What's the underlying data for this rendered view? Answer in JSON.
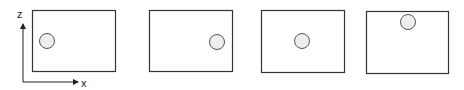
{
  "axes": {
    "vertical_label": "z",
    "horizontal_label": "x"
  },
  "panels": [
    {
      "circle_position": "left-middle"
    },
    {
      "circle_position": "right-middle"
    },
    {
      "circle_position": "center"
    },
    {
      "circle_position": "top-center"
    }
  ],
  "colors": {
    "frame": "#333333",
    "circle_fill": "#eeeeee",
    "circle_stroke": "#555555"
  }
}
